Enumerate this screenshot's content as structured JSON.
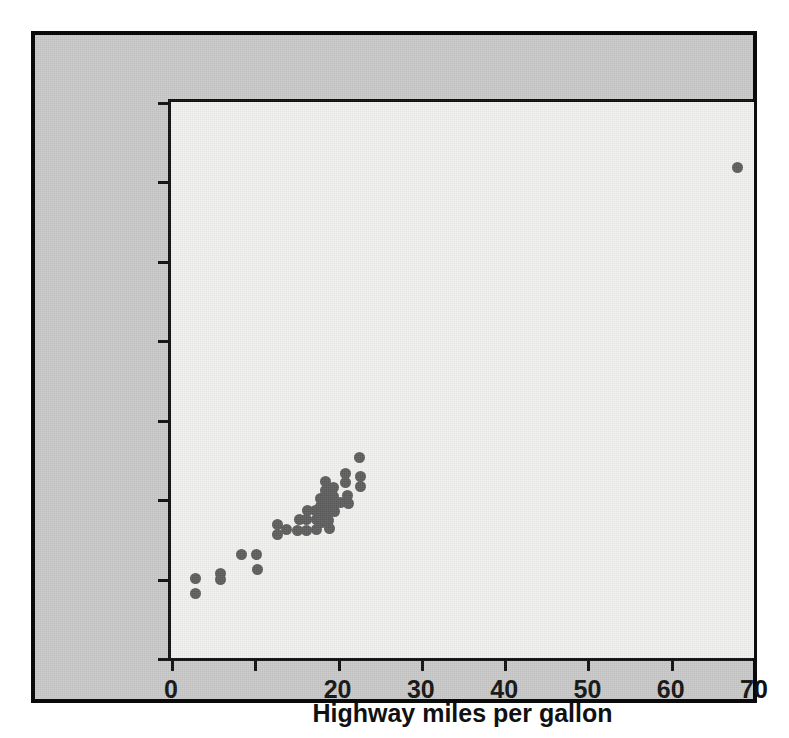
{
  "figure": {
    "background_color": "#ffffff",
    "panel_color": "#c9c9c9",
    "plot_background_color": "#f1f1ef",
    "border_color": "#0a0a0a",
    "point_color": "#5c5c5c"
  },
  "chart_data": {
    "type": "scatter",
    "title": "",
    "xlabel": "Highway miles per gallon",
    "ylabel": "City miles per gallon",
    "xlim": [
      0,
      70
    ],
    "ylim": [
      0,
      70
    ],
    "xticks": [
      0,
      10,
      20,
      30,
      40,
      50,
      60,
      70
    ],
    "xticklabels": [
      "0",
      "",
      "20",
      "30",
      "40",
      "50",
      "60",
      "70"
    ],
    "yticks": [
      0,
      10,
      20,
      30,
      40,
      50,
      60,
      70
    ],
    "yticklabels": [
      "0",
      "10",
      "20",
      "30",
      "40",
      "50",
      "60",
      "70"
    ],
    "grid": false,
    "legend": null,
    "series": [
      {
        "name": "vehicles",
        "marker": "circle",
        "color": "#5c5c5c",
        "points": [
          [
            3.0,
            10.0
          ],
          [
            3.0,
            8.1
          ],
          [
            5.9,
            10.7
          ],
          [
            5.9,
            9.9
          ],
          [
            8.5,
            13.0
          ],
          [
            10.3,
            13.0
          ],
          [
            10.4,
            11.2
          ],
          [
            12.8,
            16.8
          ],
          [
            12.8,
            15.6
          ],
          [
            13.9,
            16.2
          ],
          [
            15.2,
            16.1
          ],
          [
            15.4,
            17.4
          ],
          [
            16.3,
            17.4
          ],
          [
            16.3,
            16.0
          ],
          [
            16.4,
            18.6
          ],
          [
            17.4,
            18.6
          ],
          [
            17.5,
            17.4
          ],
          [
            17.5,
            16.2
          ],
          [
            18.0,
            20.1
          ],
          [
            18.0,
            19.1
          ],
          [
            18.1,
            18.0
          ],
          [
            18.1,
            17.0
          ],
          [
            18.6,
            22.2
          ],
          [
            18.6,
            21.1
          ],
          [
            18.8,
            20.2
          ],
          [
            18.8,
            19.3
          ],
          [
            18.9,
            18.3
          ],
          [
            18.9,
            17.3
          ],
          [
            19.0,
            16.3
          ],
          [
            19.5,
            21.5
          ],
          [
            19.5,
            20.3
          ],
          [
            19.6,
            19.4
          ],
          [
            19.6,
            18.4
          ],
          [
            20.3,
            19.6
          ],
          [
            21.0,
            23.2
          ],
          [
            21.0,
            22.1
          ],
          [
            21.2,
            20.4
          ],
          [
            21.3,
            19.4
          ],
          [
            22.6,
            25.2
          ],
          [
            22.7,
            22.8
          ],
          [
            22.7,
            21.6
          ],
          [
            68.0,
            61.7
          ]
        ]
      }
    ]
  }
}
